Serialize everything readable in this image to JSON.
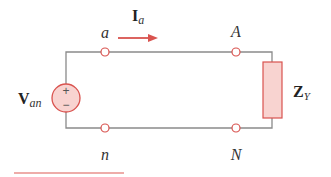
{
  "diagram": {
    "type": "circuit",
    "colors": {
      "wire": "#8a8a8a",
      "accent": "#d9534f",
      "fill": "#f8d3d0",
      "text": "#333333"
    },
    "source": {
      "name": "V",
      "subscript": "an",
      "plus_symbol": "+",
      "minus_symbol": "−"
    },
    "current": {
      "name": "I",
      "subscript": "a"
    },
    "load": {
      "name": "Z",
      "subscript": "Y"
    },
    "nodes": {
      "a": "a",
      "n": "n",
      "A": "A",
      "N": "N"
    }
  }
}
